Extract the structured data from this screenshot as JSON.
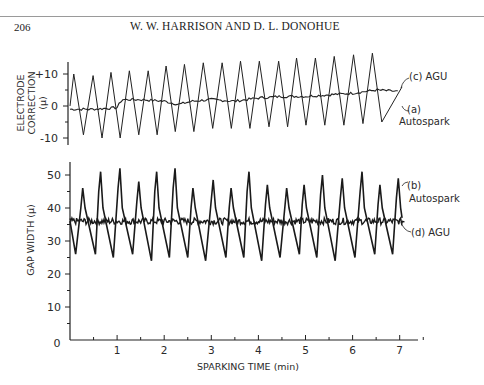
{
  "page": {
    "page_number": "206",
    "running_head": "W. W. HARRISON AND D. L. DONOHUE"
  },
  "chart_data": [
    {
      "type": "line",
      "title": "",
      "xlabel": "SPARKING TIME (min)",
      "ylabel": "ELECTRODE CORRECTION (µ)",
      "ylim": [
        -12,
        17
      ],
      "xlim": [
        0,
        7.4
      ],
      "grid": false,
      "yticks": [
        "+10",
        "0",
        "-10"
      ],
      "ytick_values": [
        10,
        0,
        -10
      ],
      "series": [
        {
          "name": "(a) Autospark",
          "description": "triangular oscillation, ~0.39 min period, drifting upward",
          "peaks_x": [
            0.08,
            0.49,
            0.87,
            1.26,
            1.66,
            2.04,
            2.43,
            2.83,
            3.23,
            3.62,
            4.02,
            4.43,
            4.81,
            5.21,
            5.61,
            6.02,
            6.42
          ],
          "peaks_y": [
            10,
            9.5,
            10.5,
            11,
            11,
            12.5,
            13,
            13.5,
            13.5,
            14,
            14,
            14,
            15,
            15,
            15.5,
            16,
            16.5
          ],
          "troughs_y": [
            -9,
            -10,
            -10,
            -9,
            -9,
            -8,
            -8,
            -7,
            -7,
            -7,
            -6.5,
            -6.5,
            -6,
            -6,
            -6,
            -5.5,
            -5,
            -5
          ]
        },
        {
          "name": "(c) AGU",
          "description": "slowly varying correction",
          "x": [
            0,
            0.5,
            1.0,
            1.1,
            1.5,
            2.0,
            2.3,
            2.6,
            3.0,
            3.5,
            4.0,
            4.5,
            5.0,
            5.5,
            6.0,
            6.5,
            7.0
          ],
          "y": [
            -1,
            -1,
            -0.5,
            2,
            2,
            1.5,
            0.5,
            1.5,
            2,
            1.5,
            2.5,
            3,
            3,
            3.5,
            4,
            5,
            4.5
          ]
        }
      ],
      "annotations": [
        "(c) AGU",
        "(a)",
        "Autospark"
      ]
    },
    {
      "type": "line",
      "title": "",
      "xlabel": "SPARKING TIME (min)",
      "ylabel": "GAP WIDTH (µ)",
      "ylim": [
        0,
        55
      ],
      "xlim": [
        0,
        7.4
      ],
      "grid": false,
      "xticks": [
        "0",
        "1",
        "2",
        "3",
        "4",
        "5",
        "6",
        "7"
      ],
      "yticks": [
        "50",
        "40",
        "30",
        "20",
        "10"
      ],
      "ytick_values": [
        50,
        40,
        30,
        20,
        10
      ],
      "series": [
        {
          "name": "(b) Autospark",
          "description": "sawtooth gap width oscillation around ~36 µ",
          "peaks_x": [
            0.27,
            0.65,
            1.06,
            1.46,
            1.84,
            2.23,
            2.61,
            3.04,
            3.42,
            3.8,
            4.19,
            4.6,
            4.97,
            5.36,
            5.78,
            6.2,
            6.58,
            6.97
          ],
          "peaks_y": [
            46,
            51,
            52,
            48,
            51,
            52,
            46,
            48.5,
            46,
            51,
            47,
            46,
            47,
            50,
            49,
            51,
            47,
            49
          ],
          "troughs_y": [
            26,
            26,
            25,
            26,
            24,
            25,
            25,
            24,
            25,
            25,
            24,
            25,
            26,
            25,
            24,
            25,
            26,
            26
          ]
        },
        {
          "name": "(d) AGU",
          "description": "nearly constant gap width",
          "x": [
            0,
            7.1
          ],
          "y": [
            36,
            36
          ],
          "noise": 1
        }
      ],
      "annotations": [
        "(b)",
        "Autospark",
        "(d) AGU"
      ]
    }
  ],
  "labels": {
    "top_ylabel_line1": "ELECTRODE",
    "top_ylabel_line2": "CORRECTION",
    "top_ylabel_line3": "(µ)",
    "bottom_ylabel": "GAP WIDTH   (µ)",
    "xlabel": "SPARKING TIME   (min)",
    "ann_c": "(c) AGU",
    "ann_a": "(a)",
    "ann_a2": "Autospark",
    "ann_b": "(b)",
    "ann_b2": "Autospark",
    "ann_d": "(d) AGU"
  }
}
